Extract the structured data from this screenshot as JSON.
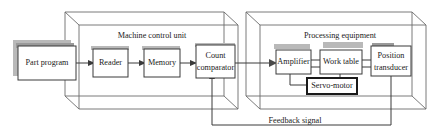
{
  "diagram": {
    "background_color": "#ffffff",
    "line_color": "#3a3a3a",
    "panel_color": "#6b6b6b",
    "shadow_color": "#b9b9b9",
    "containers": [
      {
        "id": "machine-control-unit",
        "label": "Machine control unit"
      },
      {
        "id": "processing-equipment",
        "label": "Processing equipment"
      }
    ],
    "blocks": [
      {
        "id": "part-program",
        "label": "Part program",
        "line1": "Part program",
        "line2": ""
      },
      {
        "id": "reader",
        "label": "Reader",
        "line1": "Reader",
        "line2": ""
      },
      {
        "id": "memory",
        "label": "Memory",
        "line1": "Memory",
        "line2": ""
      },
      {
        "id": "count-comparator",
        "label": "Count comparator",
        "line1": "Count",
        "line2": "comparator"
      },
      {
        "id": "amplifier",
        "label": "Amplifier",
        "line1": "Amplifier",
        "line2": ""
      },
      {
        "id": "work-table",
        "label": "Work table",
        "line1": "Work table",
        "line2": ""
      },
      {
        "id": "position-transducer",
        "label": "Position transducer",
        "line1": "Position",
        "line2": "transducer"
      },
      {
        "id": "servo-motor",
        "label": "Servo-motor",
        "line1": "Servo-motor",
        "line2": ""
      }
    ],
    "signals": [
      {
        "id": "feedback-signal",
        "label": "Feedback signal"
      }
    ]
  }
}
